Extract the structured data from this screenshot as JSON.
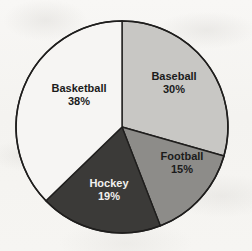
{
  "chart_data": {
    "type": "pie",
    "title": "",
    "subtitle": "",
    "xlabel": "",
    "ylabel": "",
    "legend_position": "none",
    "grid": false,
    "start_angle_clock_position": "12 o'clock",
    "direction": "clockwise",
    "units": "percent",
    "total": 102,
    "categories": [
      "Baseball",
      "Football",
      "Hockey",
      "Basketball"
    ],
    "values": [
      30,
      15,
      19,
      38
    ],
    "slices": [
      {
        "label": "Baseball",
        "value": 30,
        "value_text": "30%",
        "color": "#c8c7c4",
        "text_color": "#1b1b1b"
      },
      {
        "label": "Football",
        "value": 15,
        "value_text": "15%",
        "color": "#8d8c89",
        "text_color": "#1b1b1b"
      },
      {
        "label": "Hockey",
        "value": 19,
        "value_text": "19%",
        "color": "#3b3a38",
        "text_color": "#f2f1ef"
      },
      {
        "label": "Basketball",
        "value": 38,
        "value_text": "38%",
        "color": "#f6f5f3",
        "text_color": "#1b1b1b"
      }
    ],
    "outline_color": "#1f1e1d",
    "background_color": "#f5f4f1"
  },
  "artifacts": {
    "ghost_top_a": "",
    "ghost_top_b": "",
    "ghost_left": "",
    "ghost_right": ""
  }
}
